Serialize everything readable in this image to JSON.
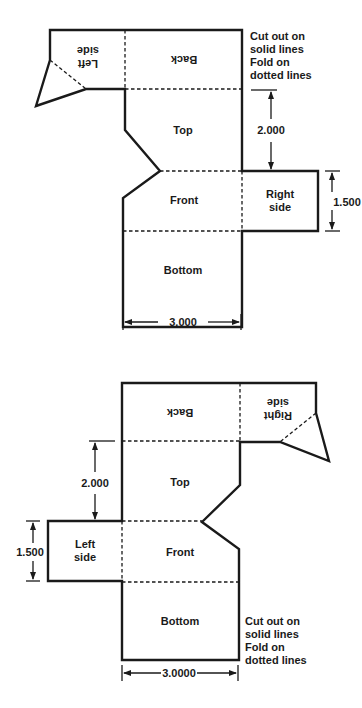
{
  "diagrams": [
    {
      "name": "net-top",
      "panels": {
        "left_side": [
          "Left",
          "side"
        ],
        "back": "Back",
        "top": "Top",
        "front": "Front",
        "right_side": [
          "Right",
          "side"
        ],
        "bottom": "Bottom"
      },
      "instructions": [
        "Cut out on",
        "solid lines",
        "Fold on",
        "dotted lines"
      ],
      "dimensions": {
        "height": "2.000",
        "side": "1.500",
        "width": "3.000"
      }
    },
    {
      "name": "net-bottom",
      "panels": {
        "back": "Back",
        "right_side": [
          "Right",
          "side"
        ],
        "top": "Top",
        "left_side": [
          "Left",
          "side"
        ],
        "front": "Front",
        "bottom": "Bottom"
      },
      "instructions": [
        "Cut out on",
        "solid lines",
        "Fold on",
        "dotted lines"
      ],
      "dimensions": {
        "height": "2.000",
        "side": "1.500",
        "width": "3.0000"
      }
    }
  ],
  "colors": {
    "line": "#1a1a1a",
    "background": "#ffffff"
  }
}
